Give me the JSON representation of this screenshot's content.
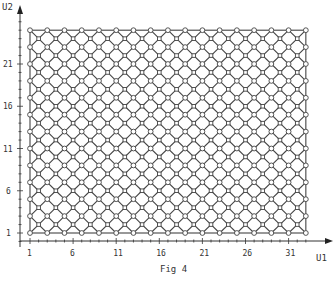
{
  "figure": {
    "caption": "Fig 4",
    "x_axis": {
      "label": "U1",
      "ticks": [
        "1",
        "6",
        "11",
        "16",
        "21",
        "26",
        "31"
      ],
      "tick_values": [
        1,
        6,
        11,
        16,
        21,
        26,
        31
      ],
      "range": [
        1,
        33
      ]
    },
    "y_axis": {
      "label": "U2",
      "ticks": [
        "1",
        "6",
        "11",
        "16",
        "21"
      ],
      "tick_values": [
        1,
        6,
        11,
        16,
        21
      ],
      "range": [
        1,
        25
      ]
    },
    "lattice": {
      "description": "Diagonal diamond mesh of circular and square nodes with rectangular boundary",
      "u1_min": 1,
      "u1_max": 33,
      "u2_min": 1,
      "u2_max": 25,
      "holes": [
        [
          11,
          19
        ],
        [
          15,
          15
        ],
        [
          11,
          11
        ]
      ]
    },
    "colors": {
      "line": "#444444",
      "background": "#ffffff"
    }
  }
}
